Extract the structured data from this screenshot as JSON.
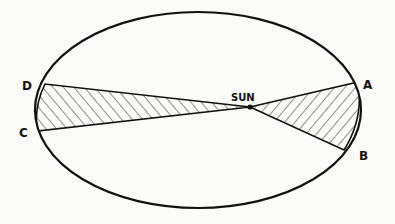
{
  "diagram": {
    "labels": {
      "sun": "SUN",
      "a": "A",
      "b": "B",
      "c": "C",
      "d": "D"
    },
    "colors": {
      "stroke": "#111111",
      "background": "#fbfbf9"
    }
  }
}
